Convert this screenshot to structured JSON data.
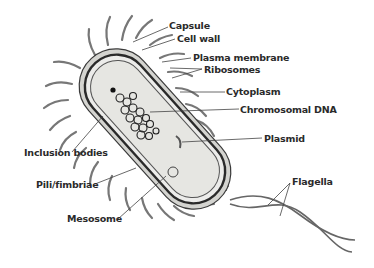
{
  "diagram": {
    "labels": {
      "capsule": "Capsule",
      "cell_wall": "Cell wall",
      "plasma_membrane": "Plasma membrane",
      "ribosomes": "Ribosomes",
      "cytoplasm": "Cytoplasm",
      "chromosomal_dna": "Chromosomal DNA",
      "plasmid": "Plasmid",
      "inclusion_bodies": "Inclusion bodies",
      "pili_fimbriae": "Pili/fimbriae",
      "flagella": "Flagella",
      "mesosome": "Mesosome"
    },
    "colors": {
      "line": "#3a3a3a",
      "cytoplasm_fill": "#e6e6e2",
      "capsule_fill": "#d4d4d0",
      "text": "#2a2a2a"
    }
  }
}
